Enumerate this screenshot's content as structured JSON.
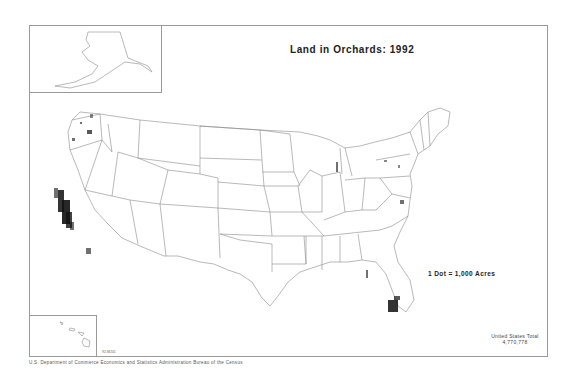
{
  "map": {
    "title": "Land in Orchards: 1992",
    "legend": "1 Dot = 1,000 Acres",
    "total_label": "United States Total",
    "total_value": "4,770,778",
    "code": "92-M201",
    "credit": "U.S. Department of Commerce   Economics and Statistics Administration   Bureau of the Census",
    "insets": [
      "Alaska",
      "Hawaii"
    ],
    "colors": {
      "border": "#9a9a9a",
      "state_line": "#8a8a8a",
      "dot": "#111111"
    },
    "dense_regions": [
      "Central Valley, California",
      "Southern California",
      "Washington (Yakima/Wenatchee)",
      "Oregon (Hood River/Willamette)",
      "Western Michigan",
      "Central/South Florida",
      "Georgia",
      "Pennsylvania/Maryland",
      "New York"
    ]
  }
}
